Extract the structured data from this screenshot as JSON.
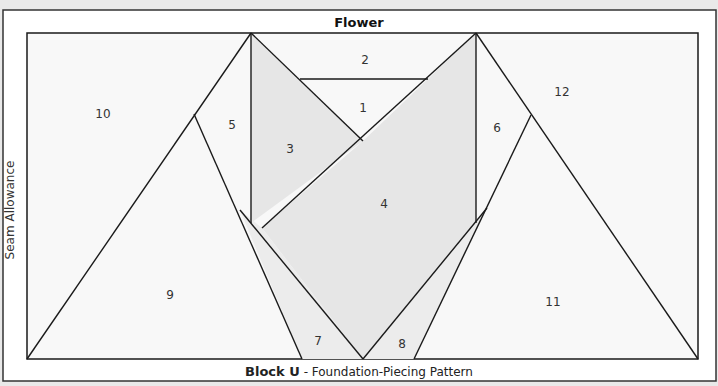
{
  "pattern": {
    "title": "Flower",
    "block_name": "Block U",
    "subtitle": " - Foundation-Piecing Pattern",
    "side_label": "Seam Allowance",
    "colors": {
      "background": "#e9e9e9",
      "frame_fill": "#ffffff",
      "piece_light": "#f8f8f8",
      "piece_shaded": "#e6e6e6",
      "line": "#1a1a1a"
    },
    "pieces": [
      {
        "number": "1",
        "x": 363,
        "y": 108
      },
      {
        "number": "2",
        "x": 365,
        "y": 60
      },
      {
        "number": "3",
        "x": 290,
        "y": 149
      },
      {
        "number": "4",
        "x": 384,
        "y": 204
      },
      {
        "number": "5",
        "x": 232,
        "y": 125
      },
      {
        "number": "6",
        "x": 497,
        "y": 128
      },
      {
        "number": "7",
        "x": 318,
        "y": 341
      },
      {
        "number": "8",
        "x": 402,
        "y": 344
      },
      {
        "number": "9",
        "x": 170,
        "y": 295
      },
      {
        "number": "10",
        "x": 103,
        "y": 114
      },
      {
        "number": "11",
        "x": 553,
        "y": 302
      },
      {
        "number": "12",
        "x": 562,
        "y": 92
      }
    ]
  }
}
